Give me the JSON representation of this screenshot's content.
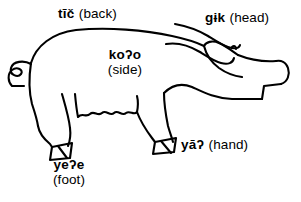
{
  "figure": {
    "background_color": "#ffffff",
    "line_color": "#000000"
  },
  "labels": {
    "back": {
      "term": "tīč",
      "gloss": "(back)",
      "part": "back"
    },
    "head": {
      "term": "gɨk",
      "gloss": "(head)",
      "part": "head"
    },
    "side": {
      "term": "koʔo",
      "gloss": "(side)",
      "part": "side"
    },
    "hand": {
      "term": "yāʔ",
      "gloss": "(hand)",
      "part": "hand"
    },
    "foot": {
      "term": "yeʔe",
      "gloss": "(foot)",
      "part": "foot"
    }
  }
}
